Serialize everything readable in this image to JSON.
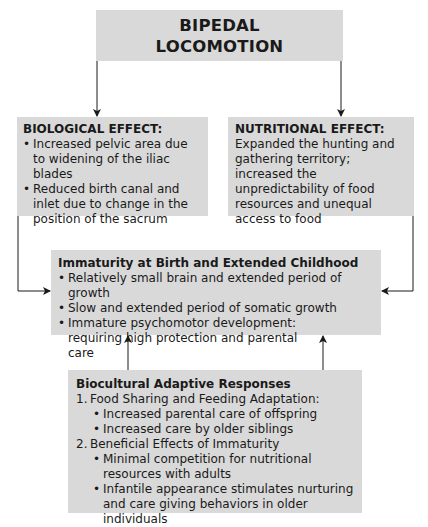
{
  "title": {
    "line1": "BIPEDAL",
    "line2": "LOCOMOTION"
  },
  "biological_effect": {
    "heading": "BIOLOGICAL EFFECT:",
    "bullets": [
      "Increased pelvic area due to widening of the iliac blades",
      "Reduced birth canal and inlet due to change in the position of the sacrum"
    ]
  },
  "nutritional_effect": {
    "heading": "NUTRITIONAL EFFECT:",
    "text": "Expanded the hunting and gathering territory; increased the unpredictability of food resources and unequal access to food"
  },
  "immaturity": {
    "heading": "Immaturity at Birth and Extended Childhood",
    "bullets": [
      "Relatively small brain and extended period of growth",
      "Slow and extended period of somatic growth",
      "Immature psychomotor development: requiring high protection and parental care"
    ]
  },
  "biocultural": {
    "heading": "Biocultural Adaptive Responses",
    "items": [
      {
        "number": "1.",
        "label": "Food Sharing and Feeding Adaptation:",
        "bullets": [
          "Increased parental care of offspring",
          "Increased care by older siblings"
        ]
      },
      {
        "number": "2.",
        "label": "Beneficial Effects of Immaturity",
        "bullets": [
          "Minimal competition for nutritional resources with adults",
          "Infantile appearance stimulates nurturing and care giving behaviors in older individuals"
        ]
      }
    ]
  },
  "bullet_glyph": "•",
  "colors": {
    "box_fill": "#d9d9d9",
    "line": "#1a1a1a",
    "text": "#1a1a1a"
  }
}
